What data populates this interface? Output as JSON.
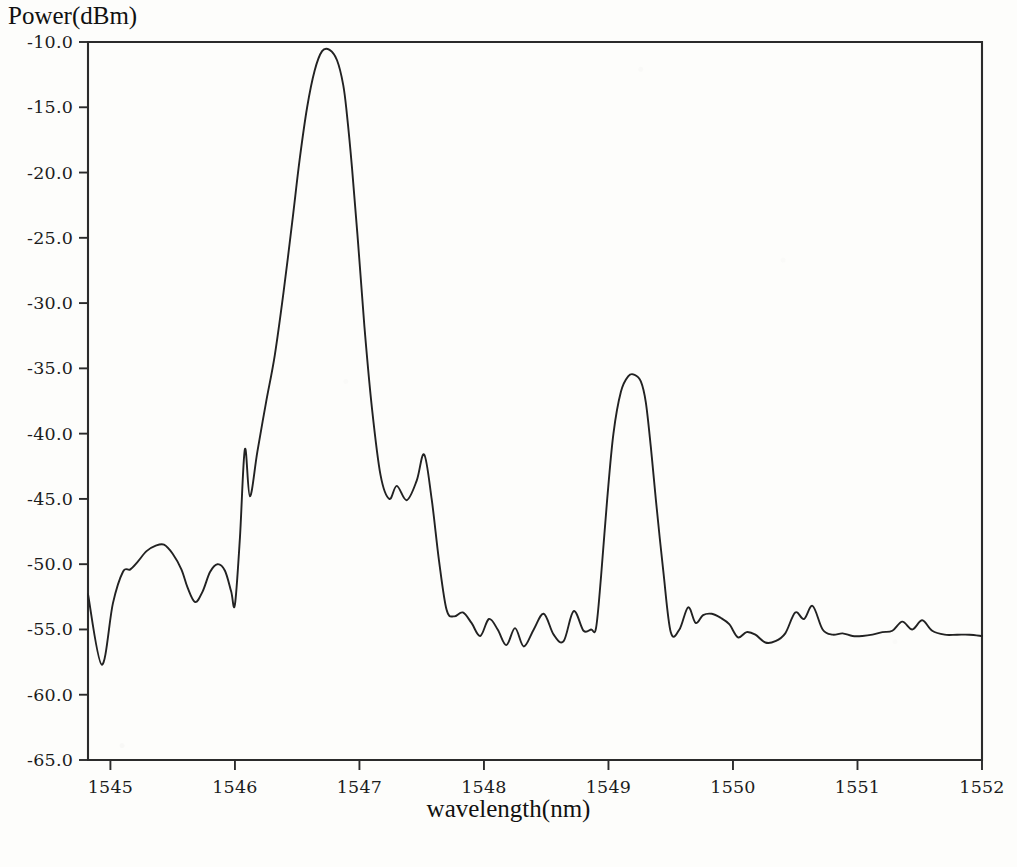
{
  "chart_data": {
    "type": "line",
    "title": "",
    "xlabel": "wavelength(nm)",
    "ylabel": "Power(dBm)",
    "xlim": [
      1544.82,
      1552.0
    ],
    "ylim": [
      -65.0,
      -10.0
    ],
    "grid": false,
    "legend": null,
    "xticks": [
      1545,
      1546,
      1547,
      1548,
      1549,
      1550,
      1551,
      1552
    ],
    "xtick_labels": [
      "1545",
      "1546",
      "1547",
      "1548",
      "1549",
      "1550",
      "1551",
      "1552"
    ],
    "yticks": [
      -10.0,
      -15.0,
      -20.0,
      -25.0,
      -30.0,
      -35.0,
      -40.0,
      -45.0,
      -50.0,
      -55.0,
      -60.0,
      -65.0
    ],
    "ytick_labels": [
      "-10.0",
      "-15.0",
      "-20.0",
      "-25.0",
      "-30.0",
      "-35.0",
      "-40.0",
      "-45.0",
      "-50.0",
      "-55.0",
      "-60.0",
      "-65.0"
    ],
    "line_color": "#222222",
    "annotations": [],
    "series": [
      {
        "name": "optical spectrum",
        "x": [
          1544.82,
          1544.93,
          1545.02,
          1545.1,
          1545.16,
          1545.22,
          1545.29,
          1545.36,
          1545.43,
          1545.5,
          1545.57,
          1545.62,
          1545.68,
          1545.74,
          1545.8,
          1545.86,
          1545.92,
          1545.97,
          1546.0,
          1546.04,
          1546.08,
          1546.12,
          1546.18,
          1546.25,
          1546.32,
          1546.39,
          1546.46,
          1546.52,
          1546.58,
          1546.64,
          1546.7,
          1546.76,
          1546.82,
          1546.87,
          1546.9,
          1546.94,
          1546.99,
          1547.04,
          1547.1,
          1547.17,
          1547.24,
          1547.3,
          1547.38,
          1547.46,
          1547.52,
          1547.58,
          1547.64,
          1547.7,
          1547.76,
          1547.83,
          1547.9,
          1547.97,
          1548.04,
          1548.11,
          1548.18,
          1548.25,
          1548.32,
          1548.4,
          1548.48,
          1548.56,
          1548.64,
          1548.72,
          1548.8,
          1548.86,
          1548.9,
          1548.94,
          1548.99,
          1549.04,
          1549.1,
          1549.16,
          1549.21,
          1549.26,
          1549.3,
          1549.34,
          1549.38,
          1549.44,
          1549.5,
          1549.57,
          1549.64,
          1549.7,
          1549.76,
          1549.83,
          1549.9,
          1549.97,
          1550.04,
          1550.11,
          1550.18,
          1550.26,
          1550.34,
          1550.42,
          1550.5,
          1550.57,
          1550.64,
          1550.72,
          1550.8,
          1550.88,
          1550.96,
          1551.04,
          1551.12,
          1551.2,
          1551.28,
          1551.36,
          1551.44,
          1551.52,
          1551.6,
          1551.7,
          1551.8,
          1551.9,
          1552.0
        ],
        "y": [
          -52.3,
          -57.7,
          -53.0,
          -50.6,
          -50.4,
          -49.8,
          -49.0,
          -48.6,
          -48.5,
          -49.2,
          -50.4,
          -51.8,
          -52.9,
          -52.1,
          -50.6,
          -50.0,
          -50.5,
          -52.1,
          -53.1,
          -48.0,
          -41.2,
          -44.8,
          -41.4,
          -37.6,
          -34.0,
          -29.2,
          -23.8,
          -19.0,
          -15.0,
          -12.2,
          -10.7,
          -10.6,
          -11.4,
          -13.3,
          -15.6,
          -19.6,
          -25.5,
          -31.8,
          -38.0,
          -43.2,
          -45.0,
          -44.0,
          -45.1,
          -43.6,
          -41.6,
          -45.0,
          -49.8,
          -53.5,
          -54.0,
          -53.7,
          -54.5,
          -55.5,
          -54.2,
          -55.0,
          -56.2,
          -54.9,
          -56.3,
          -55.0,
          -53.8,
          -55.4,
          -55.9,
          -53.6,
          -55.1,
          -55.0,
          -54.9,
          -51.0,
          -45.0,
          -40.0,
          -36.8,
          -35.6,
          -35.5,
          -36.0,
          -37.6,
          -41.0,
          -45.0,
          -50.5,
          -55.2,
          -55.0,
          -53.3,
          -54.5,
          -53.9,
          -53.8,
          -54.1,
          -54.6,
          -55.6,
          -55.2,
          -55.4,
          -56.0,
          -55.9,
          -55.3,
          -53.7,
          -54.2,
          -53.2,
          -55.0,
          -55.4,
          -55.3,
          -55.5,
          -55.5,
          -55.4,
          -55.2,
          -55.1,
          -54.4,
          -55.0,
          -54.3,
          -55.1,
          -55.4,
          -55.4,
          -55.4,
          -55.5
        ]
      }
    ]
  },
  "axis_titles": {
    "y": "Power(dBm)",
    "x": "wavelength(nm)"
  }
}
